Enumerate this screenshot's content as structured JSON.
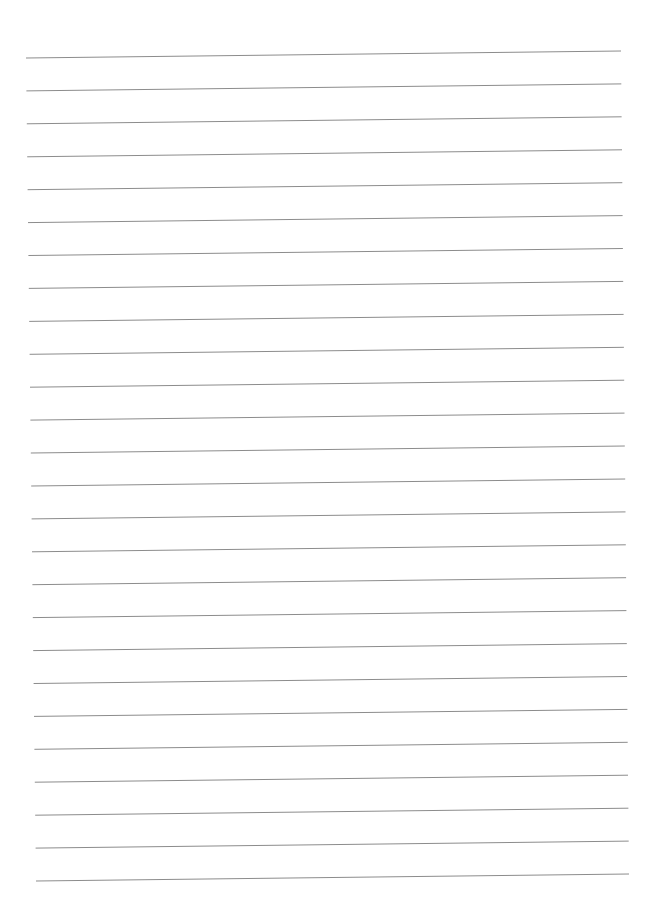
{
  "page": {
    "type": "blank-lined-paper",
    "background_color": "#ffffff",
    "line_color": "#8c8c8c",
    "line_count": 26,
    "text_content": []
  }
}
